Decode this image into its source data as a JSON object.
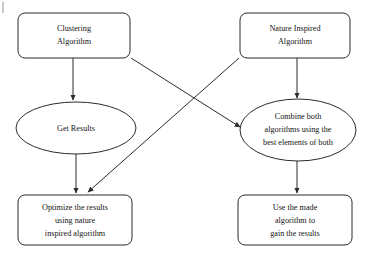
{
  "diagram": {
    "type": "flowchart",
    "background_color": "#ffffff",
    "stroke_color": "#2b2b2b",
    "text_color": "#141414",
    "nodes": [
      {
        "id": "clustering-algorithm",
        "shape": "rounded-rectangle",
        "lines": [
          "Clustering",
          "Algorithm"
        ],
        "x": 18,
        "y": 13,
        "w": 112,
        "h": 45
      },
      {
        "id": "nature-inspired-algorithm",
        "shape": "rounded-rectangle",
        "lines": [
          "Nature Inspired",
          "Algorithm"
        ],
        "x": 240,
        "y": 13,
        "w": 110,
        "h": 45
      },
      {
        "id": "get-results",
        "shape": "ellipse",
        "lines": [
          "Get Results"
        ],
        "cx": 76,
        "cy": 128,
        "rx": 60,
        "ry": 26
      },
      {
        "id": "combine-both-algorithms",
        "shape": "ellipse",
        "lines": [
          "Combine both",
          "algorithms using the",
          "best elements of both"
        ],
        "cx": 298,
        "cy": 130,
        "rx": 58,
        "ry": 31
      },
      {
        "id": "optimize-the-results",
        "shape": "rounded-rectangle",
        "lines": [
          "Optimize the results",
          "using nature",
          "inspired algorithm"
        ],
        "x": 18,
        "y": 195,
        "w": 114,
        "h": 50
      },
      {
        "id": "use-the-made-algorithm",
        "shape": "rounded-rectangle",
        "lines": [
          "Use the made",
          "algorithm to",
          "gain the results"
        ],
        "x": 238,
        "y": 195,
        "w": 114,
        "h": 50
      }
    ],
    "edges": [
      {
        "id": "clustering-to-get-results",
        "from": "clustering-algorithm",
        "to": "get-results",
        "x1": 73,
        "y1": 58,
        "x2": 73,
        "y2": 100,
        "arrow": true
      },
      {
        "id": "nature-to-combine",
        "from": "nature-inspired-algorithm",
        "to": "combine-both-algorithms",
        "x1": 297,
        "y1": 58,
        "x2": 297,
        "y2": 98,
        "arrow": true
      },
      {
        "id": "get-results-to-optimize",
        "from": "get-results",
        "to": "optimize-the-results",
        "x1": 76,
        "y1": 154,
        "x2": 76,
        "y2": 193,
        "arrow": true
      },
      {
        "id": "combine-to-use-made",
        "from": "combine-both-algorithms",
        "to": "use-the-made-algorithm",
        "x1": 297,
        "y1": 161,
        "x2": 297,
        "y2": 193,
        "arrow": true
      },
      {
        "id": "clustering-to-combine",
        "from": "clustering-algorithm",
        "to": "combine-both-algorithms",
        "x1": 131,
        "y1": 58,
        "x2": 240,
        "y2": 127,
        "arrow": true
      },
      {
        "id": "nature-to-optimize",
        "from": "nature-inspired-algorithm",
        "to": "optimize-the-results",
        "x1": 239,
        "y1": 58,
        "x2": 88,
        "y2": 192,
        "arrow": true
      }
    ]
  }
}
